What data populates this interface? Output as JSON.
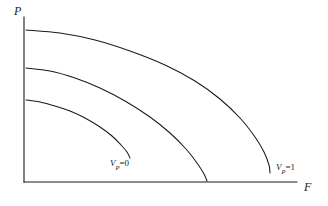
{
  "figure": {
    "background_color": "#ffffff",
    "line_color": "#1a1a1a"
  },
  "axes": {
    "y_label": "P",
    "x_label": "F",
    "origin": {
      "x": 24,
      "y": 182
    },
    "y_top": 17,
    "x_right": 297
  },
  "labels": {
    "inner": {
      "var": "V",
      "sub": "P",
      "eq": "=0"
    },
    "outer": {
      "var": "V",
      "sub": "P",
      "eq": "=1"
    }
  },
  "chart_data": {
    "type": "line",
    "title": "",
    "xlabel": "F",
    "ylabel": "P",
    "grid": false,
    "legend": "none",
    "axis_style": "open-corner-arrowless",
    "xlim": [
      0,
      1.0
    ],
    "ylim": [
      0,
      1.0
    ],
    "series": [
      {
        "name": "V_P=0",
        "label": "V_P=0",
        "label_position": {
          "x": 110,
          "y": 159
        },
        "p_intercept": 0.5,
        "f_intercept": 0.39,
        "points_px": [
          [
            26,
            100
          ],
          [
            40,
            102
          ],
          [
            55,
            106
          ],
          [
            70,
            111
          ],
          [
            85,
            118
          ],
          [
            100,
            127
          ],
          [
            112,
            136
          ],
          [
            121,
            145
          ],
          [
            127,
            152
          ],
          [
            130,
            158
          ]
        ]
      },
      {
        "name": "V_P=mid",
        "label": "",
        "p_intercept": 0.69,
        "f_intercept": 0.67,
        "points_px": [
          [
            26,
            68
          ],
          [
            50,
            71
          ],
          [
            75,
            78
          ],
          [
            100,
            88
          ],
          [
            125,
            101
          ],
          [
            150,
            117
          ],
          [
            170,
            133
          ],
          [
            186,
            149
          ],
          [
            197,
            163
          ],
          [
            204,
            174
          ],
          [
            207,
            181
          ]
        ]
      },
      {
        "name": "V_P=1",
        "label": "V_P=1",
        "label_position": {
          "x": 276,
          "y": 163
        },
        "p_intercept": 0.93,
        "f_intercept": 0.9,
        "points_px": [
          [
            26,
            30
          ],
          [
            60,
            33
          ],
          [
            95,
            40
          ],
          [
            130,
            51
          ],
          [
            165,
            65
          ],
          [
            195,
            81
          ],
          [
            220,
            99
          ],
          [
            240,
            118
          ],
          [
            255,
            137
          ],
          [
            264,
            152
          ],
          [
            269,
            165
          ],
          [
            270,
            173
          ]
        ]
      }
    ]
  }
}
